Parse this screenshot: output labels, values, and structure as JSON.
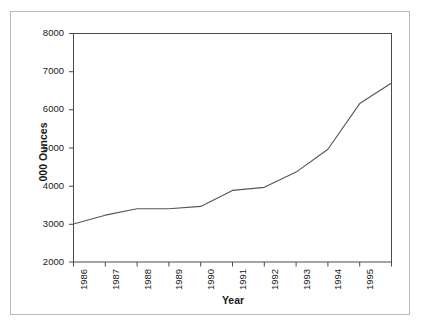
{
  "chart_data": {
    "type": "line",
    "title": "",
    "xlabel": "Year",
    "ylabel": "000 Ounces",
    "ylim": [
      2000,
      8000
    ],
    "y_ticks": [
      2000,
      3000,
      4000,
      5000,
      6000,
      7000,
      8000
    ],
    "x_tick_labels": [
      "1986",
      "1987",
      "1988",
      "1989",
      "1990",
      "1991",
      "1992",
      "1993",
      "1994",
      "1995"
    ],
    "grid": false,
    "legend": null,
    "line_color": "#555555",
    "series": [
      {
        "name": "Gold production",
        "x": [
          "1986",
          "1987",
          "1988",
          "1989",
          "1990",
          "1991",
          "1992",
          "1993",
          "1994",
          "1995",
          "1996"
        ],
        "values": [
          3000,
          3230,
          3400,
          3400,
          3460,
          3880,
          3960,
          4360,
          4960,
          6160,
          6700
        ]
      }
    ]
  },
  "axes": {
    "y_title": "000 Ounces",
    "x_title": "Year",
    "y_labels": [
      "8000",
      "7000",
      "6000",
      "5000",
      "4000",
      "3000",
      "2000"
    ],
    "x_labels": [
      "1986",
      "1987",
      "1988",
      "1989",
      "1990",
      "1991",
      "1992",
      "1993",
      "1994",
      "1995"
    ]
  }
}
